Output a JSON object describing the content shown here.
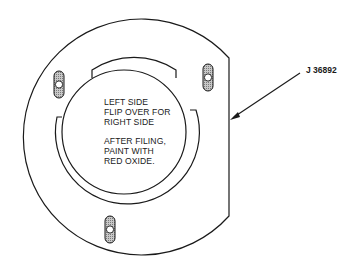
{
  "diagram": {
    "type": "technical-illustration",
    "colors": {
      "line": "#1a1a1a",
      "hatch": "#9a9a9a",
      "background": "#ffffff"
    },
    "callout": {
      "label": "J 36892"
    },
    "note": {
      "lines_group_1": [
        "LEFT SIDE",
        "FLIP OVER FOR",
        "RIGHT SIDE"
      ],
      "lines_group_2": [
        "AFTER FILING,",
        "PAINT WITH",
        "RED OXIDE."
      ]
    },
    "slots": [
      {
        "name": "upper-left",
        "cx": 59,
        "cy": 88
      },
      {
        "name": "upper-right",
        "cx": 208,
        "cy": 77
      },
      {
        "name": "bottom",
        "cx": 110,
        "cy": 226
      }
    ]
  }
}
